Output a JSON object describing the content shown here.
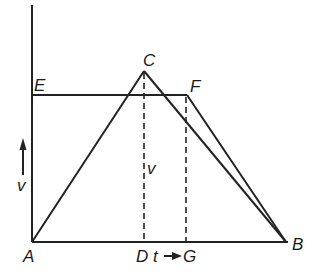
{
  "diagram": {
    "type": "velocity-time graph",
    "points": {
      "A": {
        "label": "A",
        "x": 32,
        "y": 242
      },
      "B": {
        "label": "B",
        "x": 286,
        "y": 242
      },
      "C": {
        "label": "C",
        "x": 144,
        "y": 71
      },
      "D": {
        "label": "D",
        "x": 144,
        "y": 242
      },
      "E": {
        "label": "E",
        "x": 32,
        "y": 95
      },
      "F": {
        "label": "F",
        "x": 187,
        "y": 95
      },
      "G": {
        "label": "G",
        "x": 186,
        "y": 242
      }
    },
    "labels": {
      "A": "A",
      "B": "B",
      "C": "C",
      "D": "D",
      "E": "E",
      "F": "F",
      "G": "G",
      "v_axis": "v",
      "v_inner": "v",
      "t_axis": "t"
    },
    "line_color": "#222222"
  }
}
